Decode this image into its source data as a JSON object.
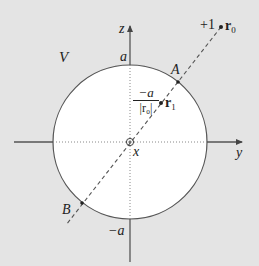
{
  "diagram": {
    "region_label": "V",
    "axes": {
      "z": {
        "label": "z"
      },
      "y": {
        "label": "y"
      },
      "x": {
        "label": "x"
      }
    },
    "sphere": {
      "top_label": "a",
      "bottom_label": "−a",
      "fill": "#ffffff",
      "background": "#e4e4e4"
    },
    "points": {
      "A": {
        "label": "A"
      },
      "B": {
        "label": "B"
      },
      "r0": {
        "charge_label": "+1",
        "label": "r",
        "subscript": "0"
      },
      "r1": {
        "label": "r",
        "subscript": "1",
        "image_charge_numerator": "−a",
        "image_charge_denominator": "|r₀|"
      }
    }
  }
}
